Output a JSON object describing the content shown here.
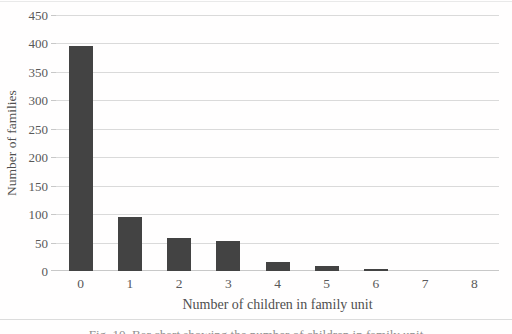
{
  "figure": {
    "caption_partial": "Fig. 10. Bar chart showing the number of children in family unit"
  },
  "chart_data": {
    "type": "bar",
    "title": "",
    "categories": [
      "0",
      "1",
      "2",
      "3",
      "4",
      "5",
      "6",
      "7",
      "8"
    ],
    "values": [
      395,
      95,
      58,
      53,
      16,
      8,
      3,
      0,
      0
    ],
    "xlabel": "Number of children in family unit",
    "ylabel": "Number of families",
    "ylim": [
      0,
      450
    ],
    "ytick_step": 50,
    "yticks": [
      0,
      50,
      100,
      150,
      200,
      250,
      300,
      350,
      400,
      450
    ],
    "grid": true,
    "legend": "none",
    "bar_width_px": 24,
    "colors": {
      "bar": "#434343",
      "gridline": "#dadada",
      "axis_line": "#c8c8c8",
      "tick_label": "#595959",
      "axis_title": "#4f4f4f",
      "background": "#ffffff"
    }
  }
}
